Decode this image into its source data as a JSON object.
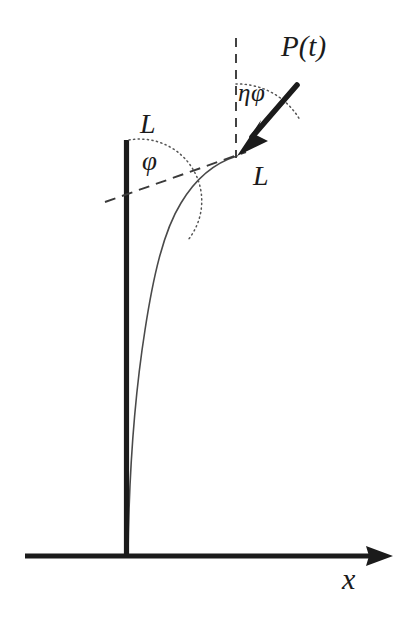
{
  "figure": {
    "background_color": "#ffffff",
    "ink_color": "#1b1b1b",
    "labels": {
      "rod_length_upper": "L",
      "deflection_angle": "φ",
      "load_angle": "ηφ",
      "force": "P(t)",
      "rod_length_tip": "L",
      "x_axis": "x"
    },
    "elements": {
      "rod": {
        "name": "vertical-rod",
        "description": "thick vertical straight rod",
        "x": 126,
        "y_top": 140,
        "y_bottom": 557,
        "thickness": 5
      },
      "ground_axis": {
        "name": "x-axis",
        "description": "horizontal ground axis with arrowhead pointing right",
        "y": 556,
        "x_start": 25,
        "x_end": 393,
        "thickness": 5,
        "arrow": "right"
      },
      "deflected_curve": {
        "name": "deflected-rod-curve",
        "description": "thin curve of the deflected elastic rod from base to tip",
        "base": [
          128,
          556
        ],
        "tip": [
          237,
          156
        ]
      },
      "tangent_dashed_line": {
        "name": "tangent-dashed-line",
        "description": "dashed straight line tangent at the rod tip, crossing the rod",
        "from": [
          105,
          201
        ],
        "to": [
          245,
          152
        ]
      },
      "vertical_dashed_line": {
        "name": "vertical-dashed-line",
        "description": "dashed vertical reference line through the tip",
        "x": 236,
        "y_top": 38,
        "y_bottom": 158
      },
      "force_arrow": {
        "name": "force-arrow",
        "description": "thick arrow of follower load P(t) pointing down-left into the rod tip",
        "from": [
          297,
          86
        ],
        "to": [
          238,
          154
        ]
      },
      "angle_arc_phi": {
        "name": "phi-angle-arc",
        "description": "dotted arc between vertical rod and tangent line",
        "center": [
          126,
          140
        ],
        "radius": 62
      },
      "angle_arc_etaphi": {
        "name": "etaphi-angle-arc",
        "description": "dotted arc between vertical dashed line and force arrow",
        "center": [
          237,
          156
        ],
        "radius": 72
      }
    }
  }
}
